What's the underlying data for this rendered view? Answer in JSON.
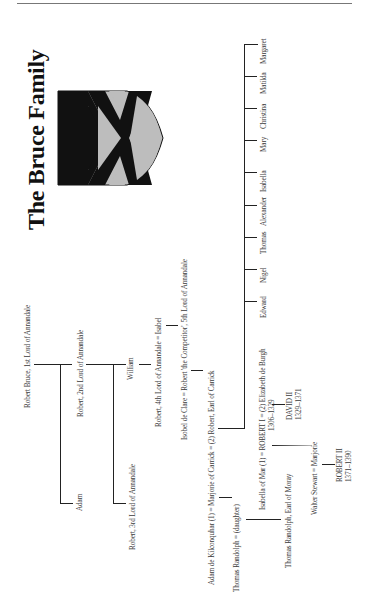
{
  "page": {
    "title": "The Bruce Family"
  },
  "shield": {
    "icon": "saltire-coat-of-arms-icon",
    "colors": {
      "field": "#bdbdbd",
      "saltire": "#111111",
      "border": "#111111"
    }
  },
  "tree": {
    "gen1": "Robert Bruce, 1st Lord of Annandale",
    "gen2_adam": "Adam",
    "gen2_robert": "Robert, 2nd Lord of Annandale",
    "gen3_robert3": "Robert, 3rd Lord of Annandale",
    "gen3_william": "William",
    "gen4": "Robert, 4th Lord of Annandale = Isabel",
    "gen5": "Isobel de Clare = Robert 'the Competitor', 5th Lord of Annandale",
    "gen6": "Adam de Kilconquhar (1) = Marjorie of Carrick = (2) Robert, Earl of Carrick",
    "randolph": "Thomas Randolph = (daughter)",
    "moray": "Thomas Randolph, Earl of Moray",
    "robert1_line": "Isabella of Mar (1) = ROBERT I = (2) Elizabeth de Burgh",
    "robert1_dates": "1306–1329",
    "david2_name": "DAVID II",
    "david2_dates": "1329–1371",
    "walter": "Walter Stewart = Marjorie",
    "robert2_name": "ROBERT II",
    "robert2_dates": "1371–1390",
    "siblings": [
      "Edward",
      "Nigel",
      "Thomas",
      "Alexander",
      "Isabella",
      "Mary",
      "Christina",
      "Matilda",
      "Margaret"
    ]
  }
}
